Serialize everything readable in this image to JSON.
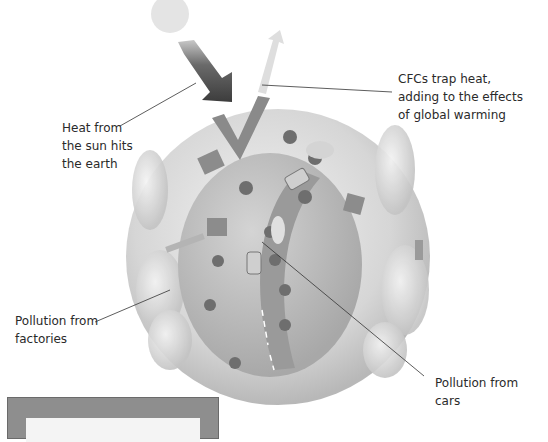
{
  "diagram": {
    "title": "",
    "labels": {
      "sun_heat": "Heat from\nthe sun hits\nthe earth",
      "cfcs": "CFCs trap heat,\nadding to the effects\nof global warming",
      "factories": "Pollution from\nfactories",
      "cars": "Pollution from\ncars"
    },
    "elements": [
      "sun",
      "incoming-heat-arrow",
      "reflected-heat-arrow",
      "earth-globe",
      "factories",
      "cars",
      "road",
      "trees",
      "smoke-clouds"
    ],
    "colors": {
      "sun": "#e4e4e4",
      "incoming_arrow": "#505050",
      "outgoing_arrow": "#dcdcdc",
      "globe_outer": "#d8d8d8",
      "globe_inner": "#bcbcbc",
      "road": "#9a9a9a",
      "box_border": "#8e8e8e"
    }
  }
}
